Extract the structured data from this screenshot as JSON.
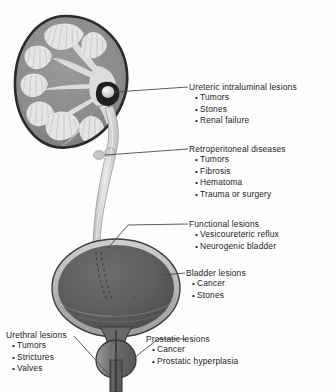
{
  "figure": {
    "background_color": "#fefefe",
    "ink_color": "#1b1b1b"
  },
  "anatomy": {
    "parts": [
      {
        "name": "kidney",
        "label": "Kidney cross-section"
      },
      {
        "name": "renal-pelvis",
        "label": "Renal pelvis"
      },
      {
        "name": "renal-stone",
        "label": "Stone in renal pelvis"
      },
      {
        "name": "ureter",
        "label": "Ureter"
      },
      {
        "name": "bladder",
        "label": "Urinary bladder"
      },
      {
        "name": "intramural-ureter",
        "label": "Intramural ureter"
      },
      {
        "name": "prostate",
        "label": "Prostate"
      },
      {
        "name": "urethra",
        "label": "Urethra"
      }
    ],
    "colors": {
      "capsule": "#3a3a3a",
      "cortex": "#8d8d8d",
      "pelvis": "#d8d8d8",
      "pyramid": "#e2e2e2",
      "bladder_fill": "#5f5f5f",
      "bladder_rim": "#b9b9b9",
      "ureter_fill": "#d6d6d6",
      "leader": "#4a4a4a"
    }
  },
  "callouts": [
    {
      "id": "ureteric",
      "heading": "Ureteric intraluminal lesions",
      "items": [
        "Tumors",
        "Stones",
        "Renal failure"
      ]
    },
    {
      "id": "retroperitoneal",
      "heading": "Retroperitoneal diseases",
      "items": [
        "Tumors",
        "Fibrosis",
        "Hematoma",
        "Trauma or surgery"
      ]
    },
    {
      "id": "functional",
      "heading": "Functional lesions",
      "items": [
        "Vesicoureteric reflux",
        "Neurogenic bladder"
      ]
    },
    {
      "id": "bladder",
      "heading": "Bladder lesions",
      "items": [
        "Cancer",
        "Stones"
      ]
    },
    {
      "id": "urethral",
      "heading": "Urethral lesions",
      "items": [
        "Tumors",
        "Strictures",
        "Valves"
      ]
    },
    {
      "id": "prostatic",
      "heading": "Prostatic lesions",
      "items": [
        "Cancer",
        "Prostatic hyperplasia"
      ]
    }
  ]
}
